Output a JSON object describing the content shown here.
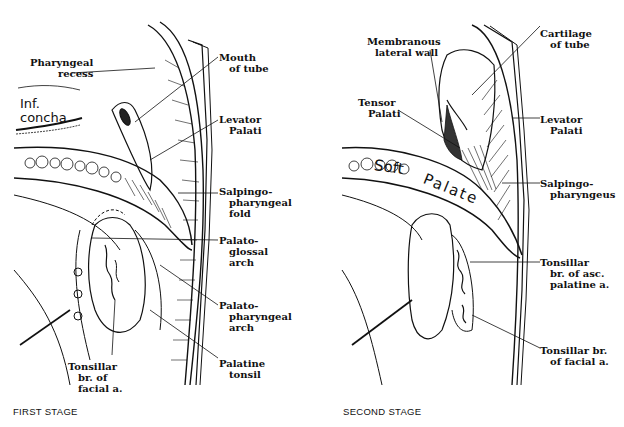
{
  "figure": {
    "panels": [
      {
        "id": "first",
        "caption": "FIRST STAGE",
        "handwritten": {
          "line1": "Inf.",
          "line2": "concha"
        },
        "labels": {
          "pharyngeal_recess": [
            "Pharyngeal",
            "recess"
          ],
          "mouth_of_tube": [
            "Mouth",
            "of tube"
          ],
          "levator_palati": [
            "Levator",
            "Palati"
          ],
          "salpingopharyngeal_fold": [
            "Salpingo-",
            "pharyngeal",
            "fold"
          ],
          "palatoglossal_arch": [
            "Palato-",
            "glossal",
            "arch"
          ],
          "palatopharyngeal_arch": [
            "Palato-",
            "pharyngeal",
            "arch"
          ],
          "palatine_tonsil": [
            "Palatine",
            "tonsil"
          ],
          "tonsillar_br_facial": [
            "Tonsillar",
            "br. of",
            "facial a."
          ]
        }
      },
      {
        "id": "second",
        "caption": "SECOND STAGE",
        "handwritten": {
          "soft": "Soft",
          "palate": "Palate"
        },
        "labels": {
          "membranous_lateral_wall": [
            "Membranous",
            "lateral wall"
          ],
          "cartilage_of_tube": [
            "Cartilage",
            "of tube"
          ],
          "tensor_palati": [
            "Tensor",
            "Palati"
          ],
          "levator_palati": [
            "Levator",
            "Palati"
          ],
          "salpingopharyngeus": [
            "Salpingo-",
            "pharyngeus"
          ],
          "tonsillar_br_asc_palatine": [
            "Tonsillar",
            "br. of asc.",
            "palatine a."
          ],
          "tonsillar_br_facial": [
            "Tonsillar br.",
            "of facial a."
          ]
        }
      }
    ]
  }
}
